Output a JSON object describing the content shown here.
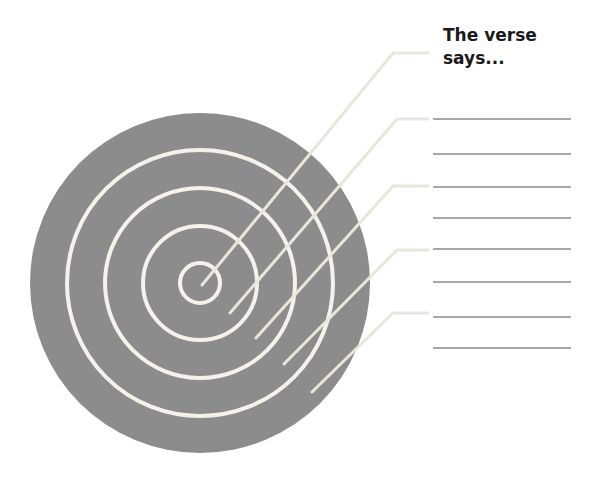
{
  "title": "The verse says...",
  "colors": {
    "target_fill": "#8c8c8c",
    "ring_stroke": "#f4f2ea",
    "leader_stroke": "#e9e7dc",
    "answer_line": "#8a8a8a",
    "background": "#ffffff"
  },
  "target": {
    "cx": 200,
    "cy": 283,
    "r": 170,
    "ring_radii": [
      20,
      57,
      95,
      133
    ]
  },
  "leaders": [
    {
      "x1": 202,
      "y1": 285,
      "xe": 393,
      "ye": 53,
      "x2": 428
    },
    {
      "x1": 230,
      "y1": 313,
      "xe": 397,
      "ye": 119,
      "x2": 428
    },
    {
      "x1": 256,
      "y1": 338,
      "xe": 393,
      "ye": 186,
      "x2": 428
    },
    {
      "x1": 284,
      "y1": 364,
      "xe": 397,
      "ye": 250,
      "x2": 428
    },
    {
      "x1": 312,
      "y1": 392,
      "xe": 393,
      "ye": 313,
      "x2": 428
    }
  ],
  "answer_lines": {
    "x1": 433,
    "x2": 571,
    "ys": [
      119,
      154,
      187,
      218,
      249,
      282,
      317,
      348
    ]
  }
}
